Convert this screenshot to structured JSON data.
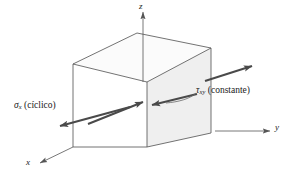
{
  "figure": {
    "type": "stress-element-diagram",
    "background_color": "#ffffff",
    "line_color": "#3d3d3d",
    "arrow_color": "#4a4a4a",
    "shaded_face_color": "#efefef",
    "top_face_color": "#fafafa"
  },
  "axes": [
    {
      "name": "z-axis",
      "label": "z",
      "direction": "up"
    },
    {
      "name": "y-axis",
      "label": "y",
      "direction": "right"
    },
    {
      "name": "x-axis",
      "label": "x",
      "direction": "lower-left"
    }
  ],
  "stresses": [
    {
      "name": "axial-stress",
      "symbol": "σ",
      "subscript": "x",
      "qualifier": "(cíclico)",
      "arrow_style": "double-headed",
      "face": "front"
    },
    {
      "name": "shear-stress",
      "symbol": "τ",
      "subscript": "xy",
      "qualifier": "(constante)",
      "arrow_style": "opposed-pair",
      "face": "right"
    }
  ]
}
